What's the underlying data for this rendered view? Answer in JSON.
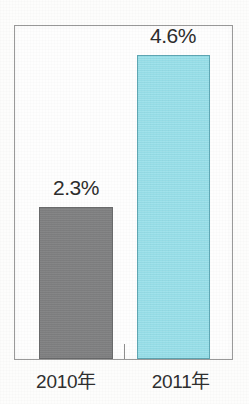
{
  "chart_data": {
    "type": "bar",
    "title": "",
    "subtitle": "",
    "xlabel": "",
    "ylabel": "",
    "categories": [
      "2010年",
      "2011年"
    ],
    "values": [
      2.3,
      4.6
    ],
    "value_labels": [
      "2.3%",
      "4.6%"
    ],
    "unit": "%",
    "ylim": [
      0,
      5.04
    ],
    "grid": false,
    "legend": null,
    "legend_position": "none",
    "series": [
      {
        "name": "",
        "values": [
          2.3,
          4.6
        ],
        "point_colors": [
          "#7f8081",
          "#96dfe9"
        ]
      }
    ],
    "bars": [
      {
        "category": "2010年",
        "value": 2.3,
        "label": "2.3%",
        "fill_color": "#7f8081",
        "border_color": "#6a6b6c"
      },
      {
        "category": "2011年",
        "value": 4.6,
        "label": "4.6%",
        "fill_color": "#96dfe9",
        "border_color": "#5fa7b4"
      }
    ],
    "annotations": []
  },
  "figure": {
    "frame_border_color": "#9a9a9a",
    "background_color": "#fdfdfc",
    "text_color": "#2d2d2d"
  },
  "axis": {
    "tick_between_categories": true
  }
}
